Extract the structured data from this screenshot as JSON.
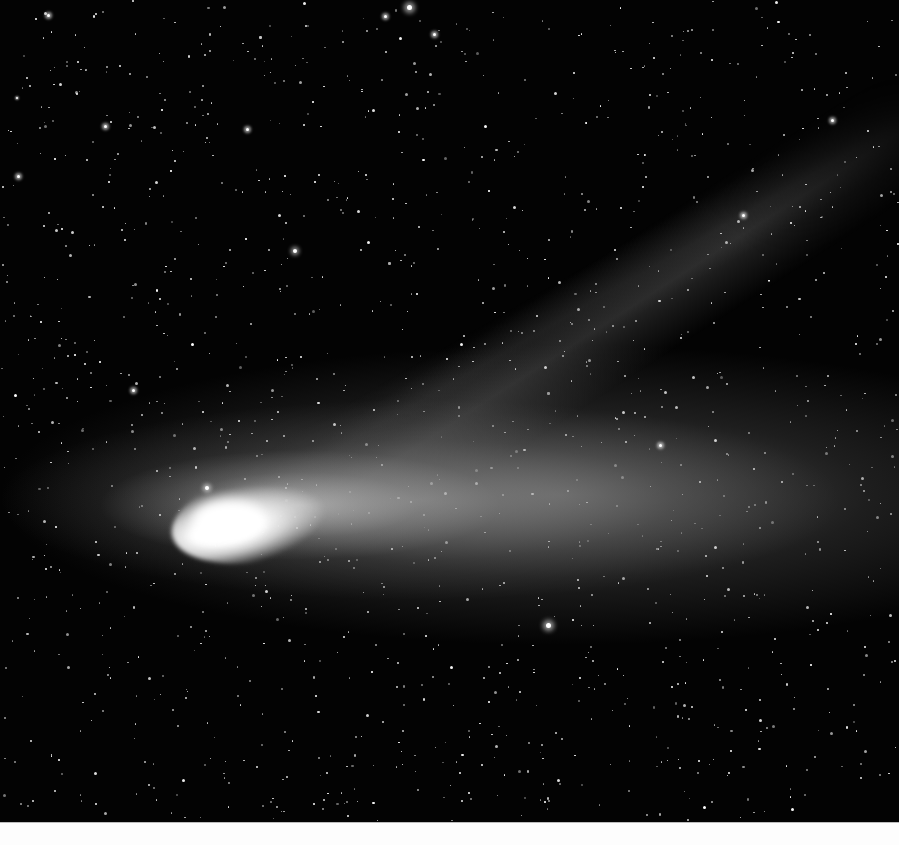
{
  "image": {
    "subject": "Comet with dust tail and ion tail against a dense star field",
    "palette": {
      "sky": "#030303",
      "star": "#ffffff",
      "nucleus": "#ffffff",
      "tail_glow": "#9a9a9a",
      "bottom_strip": "#fdfdfd"
    },
    "comet": {
      "nucleus_center": [
        215,
        520
      ],
      "dust_tail_direction": "right",
      "ion_tail_direction": "up-right"
    },
    "bright_stars": [
      [
        409,
        7,
        5
      ],
      [
        295,
        251,
        4
      ],
      [
        548,
        625,
        5
      ],
      [
        207,
        488,
        4
      ],
      [
        133,
        390,
        3
      ],
      [
        18,
        176,
        3
      ],
      [
        48,
        15,
        3
      ],
      [
        385,
        16,
        3
      ],
      [
        743,
        215,
        3
      ],
      [
        660,
        445,
        3
      ],
      [
        832,
        120,
        3
      ],
      [
        105,
        126,
        3
      ],
      [
        17,
        98,
        2
      ],
      [
        434,
        34,
        3
      ],
      [
        247,
        129,
        3
      ]
    ],
    "star_seed": 20200715,
    "star_count": 1400
  }
}
